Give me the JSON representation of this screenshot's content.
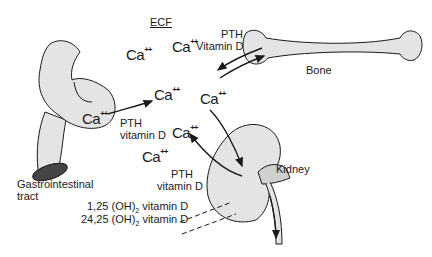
{
  "title": "ECF",
  "ion": {
    "symbol": "Ca",
    "charge": "++"
  },
  "organs": {
    "gi": "Gastrointestinal\ntract",
    "gi_line1": "Gastrointestinal",
    "gi_line2": "tract",
    "bone": "Bone",
    "kidney": "Kidney"
  },
  "regulators": {
    "bone_pth": "PTH",
    "bone_vitd": "Vitamin D",
    "gi_pth": "PTH",
    "gi_vitd": "vitamin D",
    "kidney_pth": "PTH",
    "kidney_vitd": "vitamin D"
  },
  "metabolites": [
    {
      "label": "1,25 (OH)",
      "sub": "2",
      "suffix": " vitamin D"
    },
    {
      "label": "24,25 (OH)",
      "sub": "2",
      "suffix": " vitamin D"
    }
  ],
  "colors": {
    "stroke": "#1a1a1a",
    "fill": "#e4e4e4",
    "lumen": "#444444"
  }
}
